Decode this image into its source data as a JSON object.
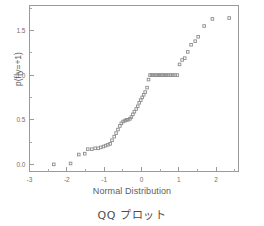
{
  "figure": {
    "caption": "QQ プロット",
    "axis_color": "#9a9a9a",
    "marker_color": "#8d8d8d",
    "text_color": "#5d5d5d",
    "background": "#ffffff"
  },
  "chart_data": {
    "type": "scatter",
    "title": "",
    "xlabel": "Normal Distribution",
    "ylabel": "p(f|y=+1)",
    "xlim": [
      -3.0,
      2.6
    ],
    "ylim": [
      -0.08,
      1.78
    ],
    "xticks": [
      -3,
      -2,
      -1,
      0,
      1,
      2
    ],
    "xticklabels": [
      "-3",
      "-2",
      "-1",
      "0",
      "1",
      "2"
    ],
    "yticks": [
      0.0,
      0.5,
      1.0,
      1.5
    ],
    "yticklabels": [
      "0.0",
      "0.5",
      "1.0",
      "1.5"
    ],
    "minor_ticks": true,
    "grid": false,
    "legend": null,
    "marker": "open-square",
    "x": [
      -2.35,
      -1.9,
      -1.68,
      -1.52,
      -1.44,
      -1.33,
      -1.24,
      -1.16,
      -1.09,
      -1.02,
      -0.96,
      -0.9,
      -0.84,
      -0.79,
      -0.73,
      -0.68,
      -0.63,
      -0.58,
      -0.54,
      -0.49,
      -0.44,
      -0.4,
      -0.36,
      -0.31,
      -0.27,
      -0.23,
      -0.19,
      -0.14,
      -0.1,
      -0.06,
      -0.02,
      0.02,
      0.06,
      0.1,
      0.15,
      0.19,
      0.23,
      0.27,
      0.31,
      0.36,
      0.4,
      0.45,
      0.49,
      0.54,
      0.58,
      0.63,
      0.68,
      0.73,
      0.79,
      0.84,
      0.9,
      0.96,
      1.02,
      1.09,
      1.16,
      1.24,
      1.33,
      1.44,
      1.52,
      1.68,
      1.9,
      2.35
    ],
    "y": [
      0.0,
      0.01,
      0.11,
      0.12,
      0.17,
      0.17,
      0.18,
      0.18,
      0.19,
      0.2,
      0.21,
      0.22,
      0.23,
      0.27,
      0.31,
      0.35,
      0.39,
      0.43,
      0.46,
      0.48,
      0.49,
      0.5,
      0.5,
      0.51,
      0.53,
      0.56,
      0.59,
      0.62,
      0.65,
      0.69,
      0.72,
      0.75,
      0.78,
      0.81,
      0.86,
      0.95,
      1.0,
      1.0,
      1.0,
      1.0,
      1.0,
      1.0,
      1.0,
      1.0,
      1.0,
      1.0,
      1.0,
      1.0,
      1.0,
      1.0,
      1.0,
      1.0,
      1.12,
      1.17,
      1.19,
      1.26,
      1.34,
      1.38,
      1.43,
      1.55,
      1.63,
      1.64
    ]
  }
}
